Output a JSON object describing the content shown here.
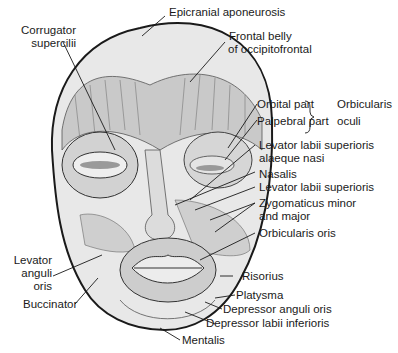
{
  "figure": {
    "colors": {
      "ink": "#1a1a1a",
      "skin": "#e6e6e6",
      "muscle": "#c8c8c8",
      "background": "#ffffff"
    }
  },
  "labels": {
    "epicranial": "Epicranial aponeurosis",
    "corrugator_1": "Corrugator",
    "corrugator_2": "supercilii",
    "frontal_1": "Frontal belly",
    "frontal_2": "of occipitofrontal",
    "orbital": "Orbital part",
    "palpebral": "Palpebral part",
    "orbicularis_oculi_1": "Orbicularis",
    "orbicularis_oculi_2": "oculi",
    "llsan_1": "Levator labii superioris",
    "llsan_2": "alaeque nasi",
    "nasalis": "Nasalis",
    "lls": "Levator labii superioris",
    "zyg_1": "Zygomaticus minor",
    "zyg_2": "and major",
    "orbicularis_oris": "Orbicularis oris",
    "lao_1": "Levator",
    "lao_2": "anguli",
    "lao_3": "oris",
    "buccinator": "Buccinator",
    "risorius": "Risorius",
    "platysma": "Platysma",
    "dao": "Depressor anguli oris",
    "dli": "Depressor labii inferioris",
    "mentalis": "Mentalis"
  }
}
